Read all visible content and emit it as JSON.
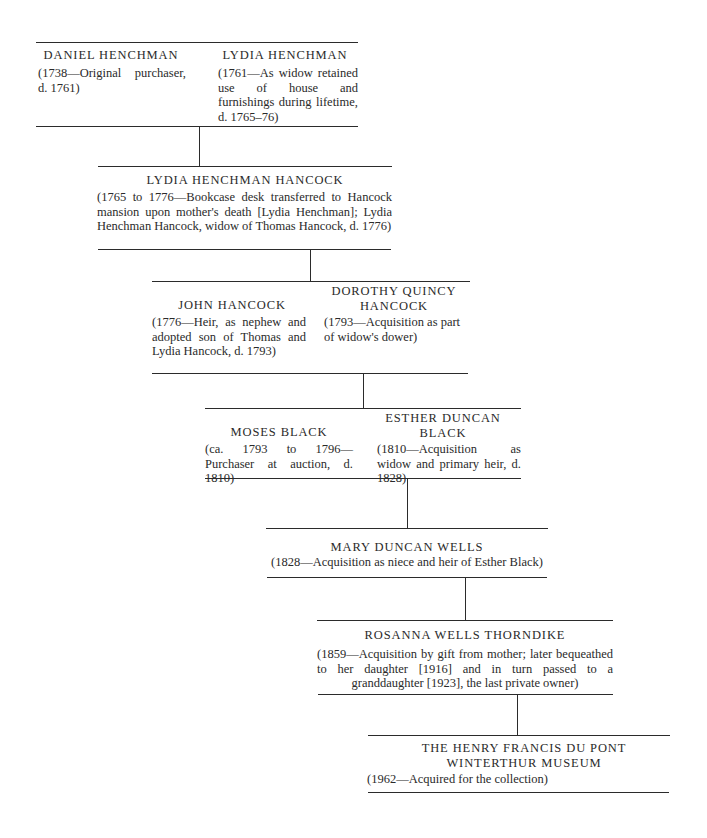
{
  "diagram": {
    "type": "provenance-chain",
    "generations": [
      {
        "owners": [
          {
            "name": "DANIEL HENCHMAN",
            "note": "(1738—Original purchaser, d. 1761)"
          },
          {
            "name": "LYDIA HENCHMAN",
            "note": "(1761—As widow retained use of house and furnishings during lifetime, d. 1765–76)"
          }
        ]
      },
      {
        "owners": [
          {
            "name": "LYDIA HENCHMAN HANCOCK",
            "note": "(1765 to 1776—Bookcase desk transferred to Hancock mansion upon mother's death [Lydia Henchman]; Lydia Henchman Hancock, widow of Thomas Hancock, d. 1776)"
          }
        ]
      },
      {
        "owners": [
          {
            "name": "JOHN HANCOCK",
            "note": "(1776—Heir, as nephew and adopted son of Thomas and Lydia Hancock, d. 1793)"
          },
          {
            "name": "DOROTHY QUINCY HANCOCK",
            "note": "(1793—Acquisition as part of widow's dower)"
          }
        ]
      },
      {
        "owners": [
          {
            "name": "MOSES BLACK",
            "note": "(ca. 1793 to 1796—Purchaser at auction, d. 1810)"
          },
          {
            "name": "ESTHER DUNCAN BLACK",
            "note": "(1810—Acquisition as widow and primary heir, d. 1828)"
          }
        ]
      },
      {
        "owners": [
          {
            "name": "MARY DUNCAN WELLS",
            "note": "(1828—Acquisition as niece and heir of Esther Black)"
          }
        ]
      },
      {
        "owners": [
          {
            "name": "ROSANNA WELLS THORNDIKE",
            "note": "(1859—Acquisition by gift from mother; later bequeathed to her daughter [1916] and in turn passed to a granddaughter [1923], the last private owner)"
          }
        ]
      },
      {
        "owners": [
          {
            "name": "THE HENRY FRANCIS DU PONT WINTERTHUR MUSEUM",
            "note": "(1962—Acquired for the collection)"
          }
        ]
      }
    ]
  },
  "labels": {
    "g0_a_name": "DANIEL HENCHMAN",
    "g0_a_note": "(1738—Original purchaser, d. 1761)",
    "g0_b_name": "LYDIA HENCHMAN",
    "g0_b_note": "(1761—As widow retained use of house and furnishings during lifetime, d. 1765–76)",
    "g1_name": "LYDIA HENCHMAN HANCOCK",
    "g1_note": "(1765 to 1776—Bookcase desk transferred to Hancock mansion upon mother's death [Lydia Henchman]; Lydia Henchman Hancock, widow of Thomas Hancock, d. 1776)",
    "g2_a_name": "JOHN HANCOCK",
    "g2_a_note": "(1776—Heir, as nephew and adopted son of Thomas and Lydia Hancock, d. 1793)",
    "g2_b_name": "DOROTHY QUINCY HANCOCK",
    "g2_b_note": "(1793—Acquisition as part of widow's dower)",
    "g3_a_name": "MOSES BLACK",
    "g3_a_note": "(ca. 1793 to 1796—Purchaser at auction, d. 1810)",
    "g3_b_name": "ESTHER DUNCAN BLACK",
    "g3_b_note": "(1810—Acquisition as widow and primary heir, d. 1828)",
    "g4_name": "MARY DUNCAN WELLS",
    "g4_note": "(1828—Acquisition as niece and heir of Esther Black)",
    "g5_name": "ROSANNA WELLS THORNDIKE",
    "g5_note": "(1859—Acquisition by gift from mother; later bequeathed to her daughter [1916] and in turn passed to a granddaughter [1923], the last private owner)",
    "g6_name": "THE HENRY FRANCIS DU PONT WINTERTHUR MUSEUM",
    "g6_note": "(1962—Acquired for the collection)"
  },
  "colors": {
    "ink": "#2a2a2a",
    "rule": "#2b2b2b",
    "background": "#ffffff"
  }
}
